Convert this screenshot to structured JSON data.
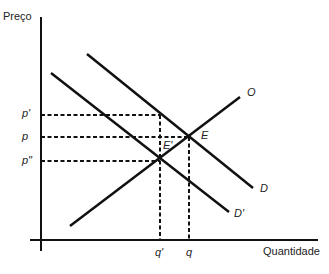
{
  "axes": {
    "y_label": "Preço",
    "x_label": "Quantidade"
  },
  "price_ticks": [
    {
      "label": "p'",
      "y": 115
    },
    {
      "label": "p",
      "y": 137
    },
    {
      "label": "p\"",
      "y": 161
    }
  ],
  "quantity_ticks": [
    {
      "label": "q'",
      "x": 160
    },
    {
      "label": "q",
      "x": 189
    }
  ],
  "curves": {
    "supply": {
      "label": "O"
    },
    "demand": {
      "label": "D"
    },
    "demand_shifted": {
      "label": "D'"
    }
  },
  "points": {
    "equilibrium": {
      "label": "E"
    },
    "new_equilibrium": {
      "label": "E'"
    }
  },
  "colors": {
    "line": "#111111",
    "text": "#222222"
  }
}
